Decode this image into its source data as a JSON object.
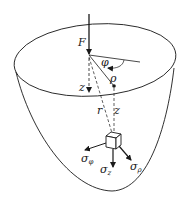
{
  "diagram": {
    "labels": {
      "force": "F",
      "angle": "φ",
      "radius_point": "ρ",
      "depth_axis": "z",
      "distance": "r",
      "depth_at_point": "z",
      "stress_phi": "σ",
      "stress_phi_sub": "φ",
      "stress_z": "σ",
      "stress_z_sub": "z",
      "stress_rho": "σ",
      "stress_rho_sub": "ρ"
    },
    "colors": {
      "stroke": "#1a1a1a",
      "background": "#ffffff"
    }
  }
}
